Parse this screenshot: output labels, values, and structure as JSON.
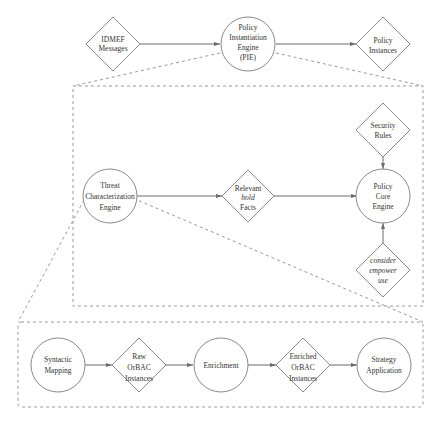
{
  "diagram": {
    "colors": {
      "stroke": "#8a8a8a",
      "edge": "#6a6a6a",
      "dashed": "#9a9a9a",
      "text": "#333333",
      "background": "#ffffff"
    },
    "top_level": {
      "idmef": {
        "shape": "diamond",
        "lines": [
          "IDMEF",
          "Messages"
        ]
      },
      "pie": {
        "shape": "circle",
        "lines": [
          "Policy",
          "Instantiation",
          "Engine",
          "(PIE)"
        ]
      },
      "policy_instances": {
        "shape": "diamond",
        "lines": [
          "Policy",
          "Instances"
        ]
      }
    },
    "pie_detail": {
      "threat_engine": {
        "shape": "circle",
        "lines": [
          "Threat",
          "Characterization",
          "Engine"
        ]
      },
      "relevant_hold": {
        "shape": "diamond",
        "lines": [
          "Relevant",
          "hold",
          "Facts"
        ],
        "italic_line": 1
      },
      "policy_core": {
        "shape": "circle",
        "lines": [
          "Policy",
          "Core",
          "Engine"
        ]
      },
      "security_rules": {
        "shape": "diamond",
        "lines": [
          "Security",
          "Rules"
        ]
      },
      "consider_empower_use": {
        "shape": "diamond",
        "lines": [
          "consider",
          "empower",
          "use"
        ],
        "italic": true
      }
    },
    "tce_detail": {
      "syntactic_mapping": {
        "shape": "circle",
        "lines": [
          "Syntactic",
          "Mapping"
        ]
      },
      "raw_orbac": {
        "shape": "diamond",
        "lines": [
          "Raw",
          "OrBAC",
          "Instances"
        ]
      },
      "enrichment": {
        "shape": "circle",
        "lines": [
          "Enrichment"
        ]
      },
      "enriched_orbac": {
        "shape": "diamond",
        "lines": [
          "Enriched",
          "OrBAC",
          "Instances"
        ]
      },
      "strategy_application": {
        "shape": "circle",
        "lines": [
          "Strategy",
          "Application"
        ]
      }
    },
    "edges": [
      [
        "IDMEF Messages",
        "Policy Instantiation Engine (PIE)"
      ],
      [
        "Policy Instantiation Engine (PIE)",
        "Policy Instances"
      ],
      [
        "Threat Characterization Engine",
        "Relevant hold Facts"
      ],
      [
        "Relevant hold Facts",
        "Policy Core Engine"
      ],
      [
        "Security Rules",
        "Policy Core Engine"
      ],
      [
        "consider empower use",
        "Policy Core Engine"
      ],
      [
        "Syntactic Mapping",
        "Raw OrBAC Instances"
      ],
      [
        "Raw OrBAC Instances",
        "Enrichment"
      ],
      [
        "Enrichment",
        "Enriched OrBAC Instances"
      ],
      [
        "Enriched OrBAC Instances",
        "Strategy Application"
      ]
    ]
  }
}
